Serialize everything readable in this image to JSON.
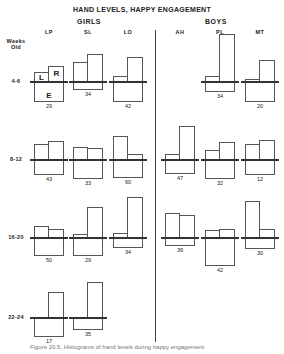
{
  "chart_data": {
    "type": "bar",
    "title": "HAND LEVELS, HAPPY ENGAGEMENT",
    "groups": [
      "GIRLS",
      "BOYS"
    ],
    "columns": [
      "LP",
      "SL",
      "LO",
      "AH",
      "PL",
      "MT"
    ],
    "column_groups": {
      "LP": "GIRLS",
      "SL": "GIRLS",
      "LO": "GIRLS",
      "AH": "BOYS",
      "PL": "BOYS",
      "MT": "BOYS"
    },
    "row_axis_label": "Weeks Old",
    "rows": [
      "4-6",
      "8-12",
      "16-20",
      "22-24"
    ],
    "legend": {
      "L": "left hand (above line)",
      "R": "right hand (above line)",
      "E": "box below line"
    },
    "cells": [
      {
        "row": "4-6",
        "col": "LP",
        "L": 10,
        "R": 16,
        "E": 20,
        "n": "29",
        "show_labels": true
      },
      {
        "row": "4-6",
        "col": "SL",
        "L": 20,
        "R": 28,
        "E": 8,
        "n": "34"
      },
      {
        "row": "4-6",
        "col": "LO",
        "L": 6,
        "R": 25,
        "E": 20,
        "n": "42"
      },
      {
        "row": "4-6",
        "col": "PL",
        "L": 6,
        "R": 48,
        "E": 10,
        "n": "34"
      },
      {
        "row": "4-6",
        "col": "MT",
        "L": 3,
        "R": 22,
        "E": 20,
        "n": "20"
      },
      {
        "row": "8-12",
        "col": "LP",
        "L": 16,
        "R": 19,
        "E": 15,
        "n": "43"
      },
      {
        "row": "8-12",
        "col": "SL",
        "L": 13,
        "R": 12,
        "E": 19,
        "n": "33"
      },
      {
        "row": "8-12",
        "col": "LO",
        "L": 24,
        "R": 6,
        "E": 18,
        "n": "60"
      },
      {
        "row": "8-12",
        "col": "AH",
        "L": 6,
        "R": 34,
        "E": 14,
        "n": "47"
      },
      {
        "row": "8-12",
        "col": "PL",
        "L": 10,
        "R": 18,
        "E": 19,
        "n": "32"
      },
      {
        "row": "8-12",
        "col": "MT",
        "L": 16,
        "R": 20,
        "E": 15,
        "n": "12"
      },
      {
        "row": "16-20",
        "col": "LP",
        "L": 12,
        "R": 9,
        "E": 18,
        "n": "50"
      },
      {
        "row": "16-20",
        "col": "SL",
        "L": 4,
        "R": 31,
        "E": 18,
        "n": "29"
      },
      {
        "row": "16-20",
        "col": "LO",
        "L": 5,
        "R": 41,
        "E": 10,
        "n": "34"
      },
      {
        "row": "16-20",
        "col": "AH",
        "L": 25,
        "R": 23,
        "E": 8,
        "n": "39"
      },
      {
        "row": "16-20",
        "col": "PL",
        "L": 8,
        "R": 9,
        "E": 28,
        "n": "42"
      },
      {
        "row": "16-20",
        "col": "MT",
        "L": 37,
        "R": 9,
        "E": 11,
        "n": "30"
      },
      {
        "row": "22-24",
        "col": "LP",
        "L": 0,
        "R": 26,
        "E": 19,
        "n": "17"
      },
      {
        "row": "22-24",
        "col": "SL",
        "L": 0,
        "R": 36,
        "E": 12,
        "n": "35"
      }
    ],
    "units": "pixel-estimated bar heights",
    "caption": "Figure 20.5. Histograms of hand levels during happy engagement"
  },
  "labels": {
    "title": "HAND LEVELS, HAPPY ENGAGEMENT",
    "girls": "GIRLS",
    "boys": "BOYS",
    "weeks": "Weeks",
    "old": "Old",
    "L": "L",
    "R": "R",
    "E": "E"
  }
}
